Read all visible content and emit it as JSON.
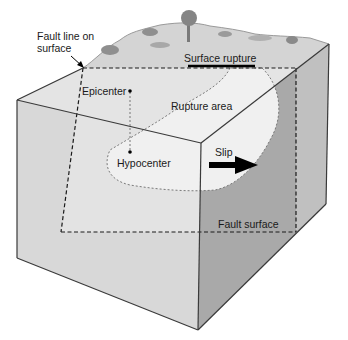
{
  "diagram": {
    "type": "block-diagram",
    "labels": {
      "fault_line": [
        "Fault line on",
        "surface"
      ],
      "surface_rupture": "Surface rupture",
      "epicenter": "Epicenter",
      "rupture_area": "Rupture area",
      "hypocenter": "Hypocenter",
      "slip": "Slip",
      "fault_surface": "Fault surface"
    },
    "icons": {
      "tree": "tree-icon",
      "shrub": "shrub-icon",
      "slip_arrow": "arrow-right-icon",
      "pointer_arrow": "arrow-pointer-icon"
    },
    "colors": {
      "outline": "#3a3a3a",
      "left_face": "#bdbdbd",
      "front_face": "#dcdcdc",
      "fault_plane_light": "#e6e6e6",
      "rupture_area": "#efefef",
      "right_block_face": "#a9a9a9",
      "right_side_face": "#c4c4c4",
      "top_surface": "#d6d6d6",
      "vegetation": "#8f8f8f",
      "slip_arrow": "#000000"
    }
  }
}
